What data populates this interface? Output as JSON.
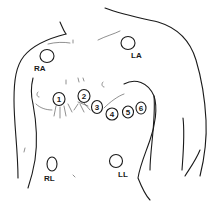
{
  "diagram": {
    "limb_electrodes": [
      {
        "label": "RA",
        "cx": 47,
        "cy": 56,
        "rx": 7,
        "ry": 6.5,
        "label_x": 36,
        "label_y": 71
      },
      {
        "label": "LA",
        "cx": 128,
        "cy": 43,
        "rx": 7,
        "ry": 6.5,
        "label_x": 133,
        "label_y": 58
      },
      {
        "label": "RL",
        "cx": 52,
        "cy": 164,
        "rx": 5,
        "ry": 7,
        "label_x": 44,
        "label_y": 181
      },
      {
        "label": "LL",
        "cx": 116,
        "cy": 161,
        "rx": 6.5,
        "ry": 6.5,
        "label_x": 118,
        "label_y": 177
      }
    ],
    "chest_electrodes": [
      {
        "label": "1",
        "cx": 59,
        "cy": 99,
        "rx": 6,
        "ry": 6.5
      },
      {
        "label": "2",
        "cx": 84,
        "cy": 96,
        "rx": 6,
        "ry": 6.5
      },
      {
        "label": "3",
        "cx": 97,
        "cy": 107,
        "rx": 5.5,
        "ry": 6.5
      },
      {
        "label": "4",
        "cx": 112,
        "cy": 114,
        "rx": 6,
        "ry": 6
      },
      {
        "label": "5",
        "cx": 128,
        "cy": 112,
        "rx": 5.5,
        "ry": 6
      },
      {
        "label": "6",
        "cx": 141,
        "cy": 108,
        "rx": 5,
        "ry": 6
      }
    ]
  }
}
